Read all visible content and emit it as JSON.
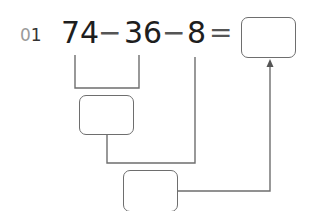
{
  "problem": {
    "number_prefix": "0",
    "number_digit": "1",
    "operand1": "74",
    "op1": "−",
    "operand2": "36",
    "op2": "−",
    "operand3": "8",
    "equals": "="
  },
  "colors": {
    "text": "#1e1e1e",
    "line": "#6e6e6e",
    "number_prefix": "#9a9a9a"
  }
}
